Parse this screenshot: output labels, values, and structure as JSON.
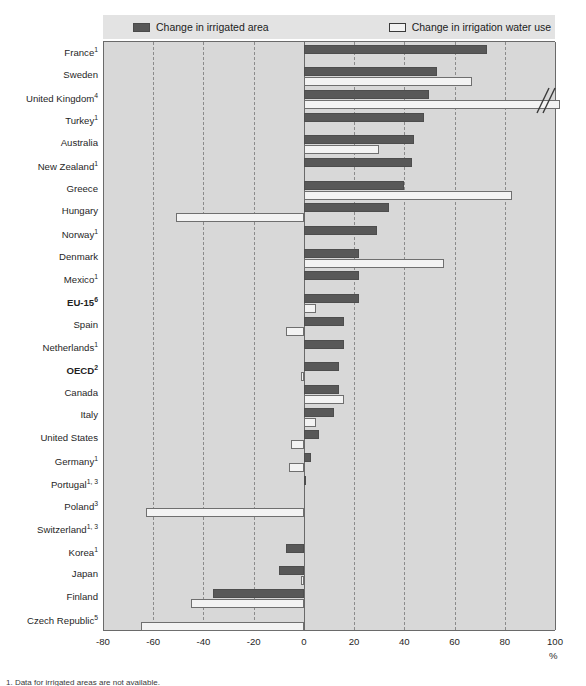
{
  "legend": {
    "items": [
      {
        "label": "Change in irrigated area",
        "swatch": "dark-swatch-icon",
        "color": "#585858"
      },
      {
        "label": "Change in irrigation water use",
        "swatch": "light-swatch-icon",
        "color": "#f3f3f3"
      }
    ]
  },
  "axis": {
    "unit": "%",
    "ticks": [
      "-80",
      "-60",
      "-40",
      "-20",
      "0",
      "20",
      "40",
      "60",
      "80",
      "100"
    ],
    "tick_values": [
      -80,
      -60,
      -40,
      -20,
      0,
      20,
      40,
      60,
      80,
      100
    ]
  },
  "chart_data": {
    "type": "bar",
    "orientation": "horizontal",
    "title": "",
    "xlabel": "%",
    "ylabel": "",
    "xlim": [
      -80,
      100
    ],
    "grid": true,
    "legend_position": "top",
    "axis_break": {
      "series": "Change in irrigation water use",
      "category": "United Kingdom",
      "note": "bar exceeds 100%, drawn with break marks"
    },
    "categories": [
      "France",
      "Sweden",
      "United Kingdom",
      "Turkey",
      "Australia",
      "New Zealand",
      "Greece",
      "Hungary",
      "Norway",
      "Denmark",
      "Mexico",
      "EU-15",
      "Spain",
      "Netherlands",
      "OECD",
      "Canada",
      "Italy",
      "United States",
      "Germany",
      "Portugal",
      "Poland",
      "Switzerland",
      "Korea",
      "Japan",
      "Finland",
      "Czech Republic"
    ],
    "category_labels": [
      {
        "name": "France",
        "footnote": "1",
        "bold": false
      },
      {
        "name": "Sweden",
        "footnote": "",
        "bold": false
      },
      {
        "name": "United Kingdom",
        "footnote": "4",
        "bold": false
      },
      {
        "name": "Turkey",
        "footnote": "1",
        "bold": false
      },
      {
        "name": "Australia",
        "footnote": "",
        "bold": false
      },
      {
        "name": "New Zealand",
        "footnote": "1",
        "bold": false
      },
      {
        "name": "Greece",
        "footnote": "",
        "bold": false
      },
      {
        "name": "Hungary",
        "footnote": "",
        "bold": false
      },
      {
        "name": "Norway",
        "footnote": "1",
        "bold": false
      },
      {
        "name": "Denmark",
        "footnote": "",
        "bold": false
      },
      {
        "name": "Mexico",
        "footnote": "1",
        "bold": false
      },
      {
        "name": "EU-15",
        "footnote": "6",
        "bold": true
      },
      {
        "name": "Spain",
        "footnote": "",
        "bold": false
      },
      {
        "name": "Netherlands",
        "footnote": "1",
        "bold": false
      },
      {
        "name": "OECD",
        "footnote": "2",
        "bold": true
      },
      {
        "name": "Canada",
        "footnote": "",
        "bold": false
      },
      {
        "name": "Italy",
        "footnote": "",
        "bold": false
      },
      {
        "name": "United States",
        "footnote": "",
        "bold": false
      },
      {
        "name": "Germany",
        "footnote": "1",
        "bold": false
      },
      {
        "name": "Portugal",
        "footnote": "1, 3",
        "bold": false
      },
      {
        "name": "Poland",
        "footnote": "3",
        "bold": false
      },
      {
        "name": "Switzerland",
        "footnote": "1, 3",
        "bold": false
      },
      {
        "name": "Korea",
        "footnote": "1",
        "bold": false
      },
      {
        "name": "Japan",
        "footnote": "",
        "bold": false
      },
      {
        "name": "Finland",
        "footnote": "",
        "bold": false
      },
      {
        "name": "Czech Republic",
        "footnote": "5",
        "bold": false
      }
    ],
    "series": [
      {
        "name": "Change in irrigated area",
        "color": "#585858",
        "values": [
          73,
          53,
          50,
          48,
          44,
          43,
          40,
          34,
          29,
          22,
          22,
          22,
          16,
          16,
          14,
          14,
          12,
          6,
          3,
          0.5,
          0,
          0,
          -7,
          -10,
          -36,
          0
        ]
      },
      {
        "name": "Change in irrigation water use",
        "color": "#f3f3f3",
        "values": [
          null,
          67,
          105,
          null,
          30,
          null,
          83,
          -51,
          null,
          56,
          null,
          5,
          -7,
          null,
          -1,
          16,
          5,
          -5,
          -6,
          null,
          -63,
          null,
          null,
          -1,
          -45,
          -65
        ]
      }
    ]
  },
  "footnote": "1. Data for irrigated areas are not available."
}
